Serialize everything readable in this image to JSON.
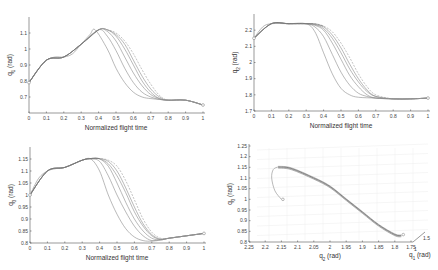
{
  "chart_data": [
    {
      "id": "q1",
      "type": "line",
      "title": "",
      "xlabel": "Normalized flight time",
      "ylabel": "q_1 (rad)",
      "xlim": [
        0,
        1
      ],
      "ylim": [
        0.6,
        1.2
      ],
      "xticks": [
        "0",
        "0.1",
        "0.2",
        "0.3",
        "0.4",
        "0.5",
        "0.6",
        "0.7",
        "0.8",
        "0.9",
        "1"
      ],
      "yticks": [
        "0.7",
        "0.8",
        "0.9",
        "1",
        "1.1"
      ],
      "grid": false,
      "series": [
        {
          "name": "trajectory 1",
          "x": [
            0,
            0.05,
            0.1,
            0.15,
            0.2,
            0.25,
            0.3,
            0.35,
            0.38,
            0.45,
            0.5,
            0.55,
            0.6,
            0.65,
            0.7,
            0.75,
            0.8,
            0.9,
            1.0
          ],
          "y": [
            0.79,
            0.87,
            0.93,
            0.95,
            0.95,
            0.97,
            1.03,
            1.09,
            1.12,
            1.0,
            0.88,
            0.79,
            0.73,
            0.7,
            0.69,
            0.685,
            0.68,
            0.68,
            0.65
          ]
        },
        {
          "name": "trajectory 2",
          "x": [
            0,
            0.1,
            0.2,
            0.3,
            0.4,
            0.45,
            0.5,
            0.55,
            0.6,
            0.65,
            0.7,
            0.75,
            0.8,
            0.9,
            1.0
          ],
          "y": [
            0.79,
            0.93,
            0.95,
            1.03,
            1.12,
            1.08,
            0.99,
            0.88,
            0.79,
            0.73,
            0.7,
            0.685,
            0.68,
            0.68,
            0.65
          ]
        },
        {
          "name": "trajectory 3",
          "x": [
            0,
            0.1,
            0.2,
            0.3,
            0.4,
            0.45,
            0.5,
            0.55,
            0.6,
            0.65,
            0.7,
            0.75,
            0.8,
            0.9,
            1.0
          ],
          "y": [
            0.79,
            0.93,
            0.95,
            1.03,
            1.12,
            1.11,
            1.05,
            0.95,
            0.85,
            0.77,
            0.715,
            0.69,
            0.68,
            0.68,
            0.65
          ]
        },
        {
          "name": "trajectory 4",
          "x": [
            0,
            0.1,
            0.2,
            0.3,
            0.4,
            0.45,
            0.5,
            0.55,
            0.6,
            0.65,
            0.7,
            0.75,
            0.8,
            0.9,
            1.0
          ],
          "y": [
            0.79,
            0.93,
            0.95,
            1.03,
            1.12,
            1.12,
            1.08,
            1.0,
            0.9,
            0.8,
            0.73,
            0.69,
            0.68,
            0.68,
            0.65
          ]
        },
        {
          "name": "trajectory 5",
          "x": [
            0,
            0.1,
            0.2,
            0.3,
            0.4,
            0.45,
            0.5,
            0.55,
            0.6,
            0.65,
            0.7,
            0.75,
            0.8,
            0.9,
            1.0
          ],
          "y": [
            0.79,
            0.93,
            0.95,
            1.03,
            1.12,
            1.12,
            1.09,
            1.03,
            0.93,
            0.83,
            0.75,
            0.7,
            0.68,
            0.68,
            0.65
          ]
        },
        {
          "name": "reference (dashed)",
          "x": [
            0,
            0.1,
            0.2,
            0.3,
            0.4,
            0.45,
            0.5,
            0.55,
            0.6,
            0.65,
            0.7,
            0.75,
            0.8,
            0.9,
            1.0
          ],
          "y": [
            0.79,
            0.93,
            0.95,
            1.03,
            1.12,
            1.12,
            1.1,
            1.05,
            0.97,
            0.87,
            0.78,
            0.71,
            0.68,
            0.68,
            0.65
          ]
        }
      ]
    },
    {
      "id": "q2",
      "type": "line",
      "title": "",
      "xlabel": "Normalized flight time",
      "ylabel": "q_2 (rad)",
      "xlim": [
        0,
        1
      ],
      "ylim": [
        1.7,
        2.3
      ],
      "xticks": [
        "0",
        "0.1",
        "0.2",
        "0.3",
        "0.4",
        "0.5",
        "0.6",
        "0.7",
        "0.8",
        "0.9",
        "1"
      ],
      "yticks": [
        "1.7",
        "1.8",
        "1.9",
        "2",
        "2.1",
        "2.2"
      ],
      "grid": false,
      "series": [
        {
          "name": "trajectory 1",
          "x": [
            0,
            0.05,
            0.1,
            0.2,
            0.3,
            0.35,
            0.4,
            0.45,
            0.5,
            0.55,
            0.6,
            0.7,
            0.8,
            0.9,
            1.0
          ],
          "y": [
            2.15,
            2.22,
            2.24,
            2.24,
            2.24,
            2.19,
            2.06,
            1.93,
            1.84,
            1.8,
            1.785,
            1.78,
            1.775,
            1.775,
            1.78
          ]
        },
        {
          "name": "trajectory 2",
          "x": [
            0,
            0.1,
            0.2,
            0.3,
            0.35,
            0.4,
            0.45,
            0.5,
            0.55,
            0.6,
            0.65,
            0.7,
            0.8,
            0.9,
            1.0
          ],
          "y": [
            2.15,
            2.24,
            2.24,
            2.24,
            2.22,
            2.16,
            2.05,
            1.94,
            1.86,
            1.81,
            1.79,
            1.78,
            1.775,
            1.775,
            1.78
          ]
        },
        {
          "name": "trajectory 3",
          "x": [
            0,
            0.1,
            0.2,
            0.3,
            0.35,
            0.4,
            0.45,
            0.5,
            0.55,
            0.6,
            0.65,
            0.7,
            0.8,
            0.9,
            1.0
          ],
          "y": [
            2.15,
            2.24,
            2.24,
            2.24,
            2.23,
            2.2,
            2.12,
            2.02,
            1.92,
            1.85,
            1.8,
            1.78,
            1.775,
            1.775,
            1.78
          ]
        },
        {
          "name": "trajectory 4",
          "x": [
            0,
            0.1,
            0.2,
            0.3,
            0.35,
            0.4,
            0.45,
            0.5,
            0.55,
            0.6,
            0.65,
            0.7,
            0.8,
            0.9,
            1.0
          ],
          "y": [
            2.15,
            2.24,
            2.24,
            2.24,
            2.235,
            2.21,
            2.15,
            2.06,
            1.96,
            1.88,
            1.82,
            1.79,
            1.775,
            1.775,
            1.78
          ]
        },
        {
          "name": "trajectory 5",
          "x": [
            0,
            0.1,
            0.2,
            0.3,
            0.35,
            0.4,
            0.45,
            0.5,
            0.55,
            0.6,
            0.65,
            0.7,
            0.8,
            0.9,
            1.0
          ],
          "y": [
            2.15,
            2.24,
            2.24,
            2.24,
            2.235,
            2.22,
            2.17,
            2.09,
            1.99,
            1.9,
            1.83,
            1.79,
            1.775,
            1.775,
            1.78
          ]
        },
        {
          "name": "reference (dashed)",
          "x": [
            0,
            0.1,
            0.2,
            0.3,
            0.35,
            0.4,
            0.45,
            0.5,
            0.55,
            0.6,
            0.65,
            0.7,
            0.8,
            0.9,
            1.0
          ],
          "y": [
            2.15,
            2.24,
            2.24,
            2.24,
            2.24,
            2.225,
            2.19,
            2.12,
            2.03,
            1.93,
            1.85,
            1.8,
            1.775,
            1.775,
            1.78
          ]
        }
      ]
    },
    {
      "id": "q3",
      "type": "line",
      "title": "",
      "xlabel": "Normalized flight time",
      "ylabel": "q_3 (rad)",
      "xlim": [
        0,
        1
      ],
      "ylim": [
        0.8,
        1.2
      ],
      "xticks": [
        "0",
        "0.1",
        "0.2",
        "0.3",
        "0.4",
        "0.5",
        "0.6",
        "0.7",
        "0.8",
        "0.9",
        "1"
      ],
      "yticks": [
        "0.8",
        "0.85",
        "0.9",
        "0.95",
        "1",
        "1.05",
        "1.1",
        "1.15"
      ],
      "grid": false,
      "series": [
        {
          "name": "trajectory 1",
          "x": [
            0,
            0.05,
            0.1,
            0.15,
            0.2,
            0.25,
            0.3,
            0.35,
            0.4,
            0.45,
            0.5,
            0.55,
            0.6,
            0.65,
            0.7,
            0.75,
            0.8,
            0.9,
            1.0
          ],
          "y": [
            1.0,
            1.07,
            1.1,
            1.11,
            1.115,
            1.13,
            1.145,
            1.15,
            1.1,
            1.0,
            0.92,
            0.86,
            0.825,
            0.81,
            0.808,
            0.815,
            0.82,
            0.83,
            0.84
          ]
        },
        {
          "name": "trajectory 2",
          "x": [
            0,
            0.1,
            0.2,
            0.3,
            0.35,
            0.4,
            0.45,
            0.5,
            0.55,
            0.6,
            0.65,
            0.7,
            0.75,
            0.8,
            0.9,
            1.0
          ],
          "y": [
            1.0,
            1.1,
            1.115,
            1.145,
            1.15,
            1.14,
            1.08,
            1.0,
            0.93,
            0.87,
            0.83,
            0.81,
            0.812,
            0.82,
            0.83,
            0.84
          ]
        },
        {
          "name": "trajectory 3",
          "x": [
            0,
            0.1,
            0.2,
            0.3,
            0.35,
            0.4,
            0.45,
            0.5,
            0.55,
            0.6,
            0.65,
            0.7,
            0.75,
            0.8,
            0.9,
            1.0
          ],
          "y": [
            1.0,
            1.1,
            1.115,
            1.145,
            1.152,
            1.15,
            1.12,
            1.05,
            0.97,
            0.9,
            0.85,
            0.82,
            0.813,
            0.82,
            0.83,
            0.84
          ]
        },
        {
          "name": "trajectory 4",
          "x": [
            0,
            0.1,
            0.2,
            0.3,
            0.35,
            0.4,
            0.45,
            0.5,
            0.55,
            0.6,
            0.65,
            0.7,
            0.75,
            0.8,
            0.9,
            1.0
          ],
          "y": [
            1.0,
            1.1,
            1.115,
            1.145,
            1.152,
            1.151,
            1.13,
            1.08,
            1.01,
            0.93,
            0.87,
            0.83,
            0.815,
            0.82,
            0.83,
            0.84
          ]
        },
        {
          "name": "trajectory 5",
          "x": [
            0,
            0.1,
            0.2,
            0.3,
            0.35,
            0.4,
            0.45,
            0.5,
            0.55,
            0.6,
            0.65,
            0.7,
            0.75,
            0.8,
            0.9,
            1.0
          ],
          "y": [
            1.0,
            1.1,
            1.115,
            1.145,
            1.152,
            1.152,
            1.14,
            1.1,
            1.03,
            0.95,
            0.88,
            0.835,
            0.816,
            0.82,
            0.83,
            0.84
          ]
        },
        {
          "name": "reference (dashed)",
          "x": [
            0,
            0.1,
            0.2,
            0.3,
            0.35,
            0.4,
            0.45,
            0.5,
            0.55,
            0.6,
            0.65,
            0.7,
            0.75,
            0.8,
            0.9,
            1.0
          ],
          "y": [
            1.0,
            1.1,
            1.115,
            1.145,
            1.152,
            1.152,
            1.145,
            1.12,
            1.06,
            0.98,
            0.9,
            0.845,
            0.82,
            0.82,
            0.83,
            0.84
          ]
        }
      ]
    },
    {
      "id": "q1q2q3",
      "type": "line",
      "title": "",
      "xlabel": "q_2 (rad)",
      "ylabel": "q_3 (rad)",
      "zlabel": "q_1 (rad)",
      "xlim": [
        2.25,
        1.75
      ],
      "ylim": [
        0.8,
        1.25
      ],
      "xticks": [
        "2.25",
        "2.2",
        "2.15",
        "2.1",
        "2.05",
        "2",
        "1.95",
        "1.9",
        "1.85",
        "1.8",
        "1.75"
      ],
      "yticks": [
        "0.8",
        "0.85",
        "0.9",
        "0.95",
        "1",
        "1.05",
        "1.1",
        "1.15",
        "1.2",
        "1.25"
      ],
      "zticks": [
        "1",
        "1.5"
      ],
      "grid": true,
      "series": [
        {
          "name": "3D trajectory (projected)",
          "q2": [
            2.15,
            2.17,
            2.18,
            2.175,
            2.16,
            2.12,
            2.05,
            2.0,
            1.95,
            1.9,
            1.85,
            1.8,
            1.78
          ],
          "q3": [
            1.0,
            1.04,
            1.1,
            1.14,
            1.152,
            1.145,
            1.1,
            1.06,
            1.0,
            0.94,
            0.88,
            0.835,
            0.83
          ]
        }
      ]
    }
  ],
  "labels": {
    "xlabel_time": "Normalized flight time",
    "q1_label_main": "q",
    "q1_label_sub": "1",
    "q2_label_sub": "2",
    "q3_label_sub": "3",
    "unit": " (rad)"
  }
}
